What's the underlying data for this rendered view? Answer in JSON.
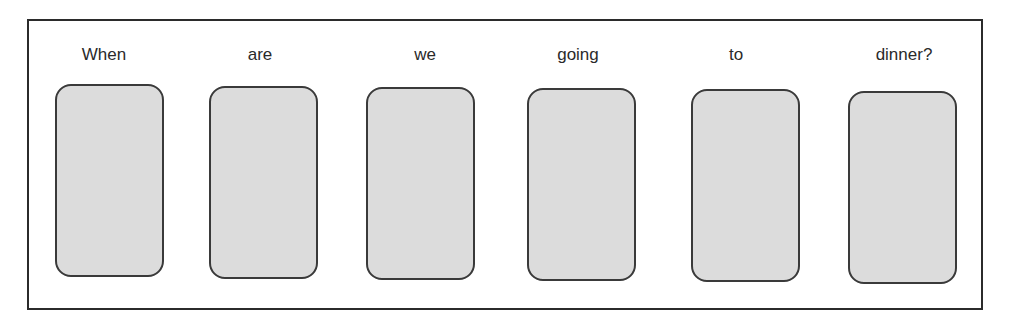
{
  "diagram": {
    "sentence": "When are we going to dinner?",
    "words": [
      {
        "text": "When",
        "center_x": 104,
        "slot_left": 55,
        "slot_top": 84
      },
      {
        "text": "are",
        "center_x": 260,
        "slot_left": 209,
        "slot_top": 86
      },
      {
        "text": "we",
        "center_x": 425,
        "slot_left": 366,
        "slot_top": 87
      },
      {
        "text": "going",
        "center_x": 578,
        "slot_left": 527,
        "slot_top": 88
      },
      {
        "text": "to",
        "center_x": 736,
        "slot_left": 691,
        "slot_top": 89
      },
      {
        "text": "dinner?",
        "center_x": 904,
        "slot_left": 848,
        "slot_top": 91
      }
    ],
    "colors": {
      "frame_border": "#2b2b2b",
      "slot_fill": "#dcdcdc",
      "slot_border": "#3a3a3a",
      "text": "#2a2a2a"
    }
  }
}
